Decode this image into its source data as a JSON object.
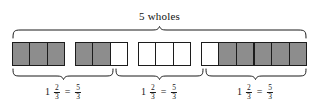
{
  "figure": {
    "title": "5 wholes",
    "total_wholes": 5,
    "cells_per_whole": 3,
    "shaded_color": "#8d8d8d",
    "unshaded_color": "#ffffff",
    "outline_color": "#1c1c1c"
  },
  "groups": [
    {
      "name": "whole-1",
      "cells": [
        "shaded",
        "shaded",
        "shaded"
      ]
    },
    {
      "name": "whole-2",
      "cells": [
        "shaded",
        "shaded",
        "empty"
      ]
    },
    {
      "name": "whole-3",
      "cells": [
        "empty",
        "empty",
        "empty"
      ]
    },
    {
      "name": "whole-4",
      "cells": [
        "empty",
        "shaded",
        "shaded"
      ]
    },
    {
      "name": "whole-5",
      "cells": [
        "shaded",
        "shaded",
        "shaded"
      ]
    }
  ],
  "equations": [
    {
      "whole": "1",
      "mixed_numerator": "2",
      "mixed_denominator": "3",
      "equals": "=",
      "improper_numerator": "5",
      "improper_denominator": "3"
    },
    {
      "whole": "1",
      "mixed_numerator": "2",
      "mixed_denominator": "3",
      "equals": "=",
      "improper_numerator": "5",
      "improper_denominator": "3"
    },
    {
      "whole": "1",
      "mixed_numerator": "2",
      "mixed_denominator": "3",
      "equals": "=",
      "improper_numerator": "5",
      "improper_denominator": "3"
    }
  ]
}
